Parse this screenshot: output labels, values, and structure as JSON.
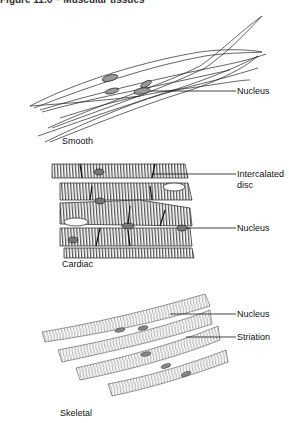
{
  "figure": {
    "title": "Figure 11.6 – Muscular tissues"
  },
  "panels": [
    {
      "name": "smooth",
      "caption": "Smooth",
      "labels": [
        {
          "text": "Nucleus"
        }
      ]
    },
    {
      "name": "cardiac",
      "caption": "Cardiac",
      "labels": [
        {
          "text": "Intercalated",
          "text2": "disc"
        },
        {
          "text": "Nucleus"
        }
      ]
    },
    {
      "name": "skeletal",
      "caption": "Skeletal",
      "labels": [
        {
          "text": "Nucleus"
        },
        {
          "text": "Striation"
        }
      ]
    }
  ]
}
